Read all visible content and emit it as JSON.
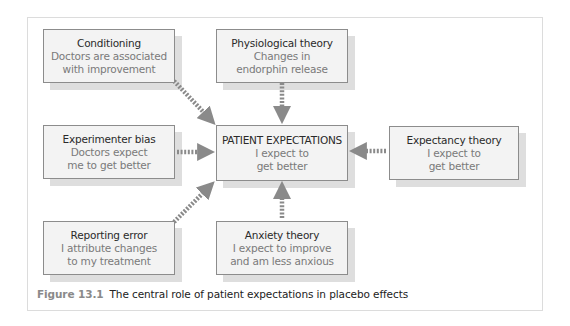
{
  "diagram": {
    "center": {
      "title": "PATIENT EXPECTATIONS",
      "lines": [
        "I expect to",
        "get better"
      ]
    },
    "nodes": [
      {
        "id": "conditioning",
        "title": "Conditioning",
        "lines": [
          "Doctors are associated",
          "with improvement"
        ]
      },
      {
        "id": "physiological",
        "title": "Physiological theory",
        "lines": [
          "Changes in",
          "endorphin release"
        ]
      },
      {
        "id": "experimenter",
        "title": "Experimenter bias",
        "lines": [
          "Doctors expect",
          "me to get better"
        ]
      },
      {
        "id": "expectancy",
        "title": "Expectancy theory",
        "lines": [
          "I expect to",
          "get better"
        ]
      },
      {
        "id": "reporting",
        "title": "Reporting error",
        "lines": [
          "I attribute changes",
          "to my treatment"
        ]
      },
      {
        "id": "anxiety",
        "title": "Anxiety theory",
        "lines": [
          "I expect to improve",
          "and am less anxious"
        ]
      }
    ],
    "edges": [
      {
        "from": "conditioning",
        "to": "center"
      },
      {
        "from": "physiological",
        "to": "center"
      },
      {
        "from": "experimenter",
        "to": "center"
      },
      {
        "from": "expectancy",
        "to": "center"
      },
      {
        "from": "reporting",
        "to": "center"
      },
      {
        "from": "anxiety",
        "to": "center"
      }
    ],
    "colors": {
      "box_fill": "#f3f3f3",
      "box_border": "#8c8c8c",
      "shadow": "#dedede",
      "arrow": "#8a8a8a",
      "title_text": "#2a2a2a",
      "sub_text": "#7a7a7a"
    }
  },
  "caption": {
    "label": "Figure 13.1",
    "text": "The central role of patient expectations in placebo effects"
  }
}
